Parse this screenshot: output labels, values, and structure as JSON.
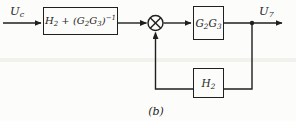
{
  "diagram": {
    "type": "control-system-block-diagram",
    "caption": "(b)",
    "colors": {
      "line": "#1f1f1f",
      "background": "#fcfcfa"
    },
    "icons": {
      "junction": "multiply-circle",
      "arrowhead": "filled-triangle",
      "branch": "filled-dot"
    },
    "labels": {
      "input": [
        [
          "t",
          "U"
        ],
        [
          "sub",
          "c"
        ]
      ],
      "output": [
        [
          "t",
          "U"
        ],
        [
          "sub",
          "7"
        ]
      ]
    },
    "blocks": {
      "controller": [
        [
          "t",
          "H"
        ],
        [
          "sub",
          "2"
        ],
        [
          "t",
          " + ("
        ],
        [
          "t",
          "G"
        ],
        [
          "sub",
          "2"
        ],
        [
          "t",
          "G"
        ],
        [
          "sub",
          "3"
        ],
        [
          "t",
          ")"
        ],
        [
          "sup",
          "−1"
        ]
      ],
      "plant": [
        [
          "t",
          "G"
        ],
        [
          "sub",
          "2"
        ],
        [
          "t",
          "G"
        ],
        [
          "sub",
          "3"
        ]
      ],
      "feedback": [
        [
          "t",
          "H"
        ],
        [
          "sub",
          "2"
        ]
      ]
    }
  }
}
